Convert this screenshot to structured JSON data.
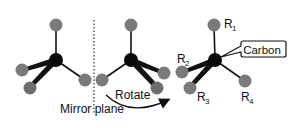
{
  "diagram": {
    "type": "chirality-mirror-rotation",
    "colors": {
      "carbon": "#0a0a0a",
      "substituent": "#7a7a7a",
      "bond": "#111111",
      "background": "#ffffff"
    },
    "labels": {
      "mirror_plane": "Mirror plane",
      "rotate": "Rotate",
      "carbon": "Carbon",
      "r1": "R",
      "r1_sub": "1",
      "r2": "R",
      "r2_sub": "2",
      "r3": "R",
      "r3_sub": "3",
      "r4": "R",
      "r4_sub": "4"
    },
    "molecules": [
      {
        "name": "original",
        "center": [
          56,
          60
        ]
      },
      {
        "name": "mirror-image",
        "center": [
          131,
          60
        ]
      },
      {
        "name": "rotated-labeled",
        "center": [
          215,
          60
        ]
      }
    ]
  }
}
